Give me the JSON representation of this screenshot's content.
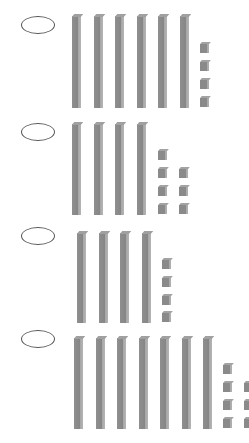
{
  "colors": {
    "block": "#8a8a8a",
    "block_side": "#b0b0b0",
    "oval_border": "#555555",
    "background": "#ffffff"
  },
  "options": [
    {
      "label": "Option 1",
      "tens": 6,
      "ones": 4,
      "value": "64",
      "selected": false
    },
    {
      "label": "Option 2",
      "tens": 4,
      "ones": 7,
      "value": "47",
      "selected": false
    },
    {
      "label": "Option 3",
      "tens": 4,
      "ones": 4,
      "value": "44",
      "selected": false
    },
    {
      "label": "Option 4",
      "tens": 7,
      "ones": 7,
      "value": "77",
      "selected": false
    }
  ]
}
